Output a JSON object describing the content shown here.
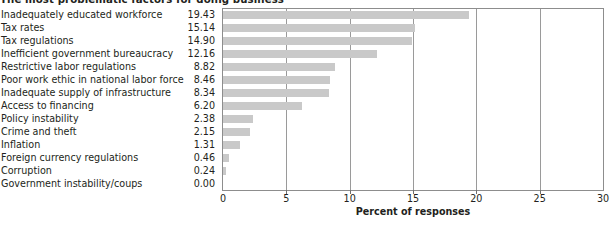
{
  "chart_data": {
    "type": "bar",
    "orientation": "horizontal",
    "title": "The most problematic factors for doing business",
    "xlabel": "Percent of responses",
    "ylabel": "",
    "xlim": [
      0,
      30
    ],
    "xticks": [
      0,
      5,
      10,
      15,
      20,
      25,
      30
    ],
    "xtick_labels": [
      "0",
      "5",
      "10",
      "15",
      "20",
      "25",
      "30"
    ],
    "grid": true,
    "legend": null,
    "bar_color": "#c9c9c9",
    "categories": [
      "Inadequately educated workforce",
      "Tax rates",
      "Tax regulations",
      "Inefficient government bureaucracy",
      "Restrictive labor regulations",
      "Poor work ethic in national labor force",
      "Inadequate supply of infrastructure",
      "Access to financing",
      "Policy instability",
      "Crime and theft",
      "Inflation",
      "Foreign currency regulations",
      "Corruption",
      "Government instability/coups"
    ],
    "values": [
      19.43,
      15.14,
      14.9,
      12.16,
      8.82,
      8.46,
      8.34,
      6.2,
      2.38,
      2.15,
      1.31,
      0.46,
      0.24,
      0.0
    ],
    "value_labels": [
      "19.43",
      "15.14",
      "14.90",
      "12.16",
      "8.82",
      "8.46",
      "8.34",
      "6.20",
      "2.38",
      "2.15",
      "1.31",
      "0.46",
      "0.24",
      "0.00"
    ]
  }
}
